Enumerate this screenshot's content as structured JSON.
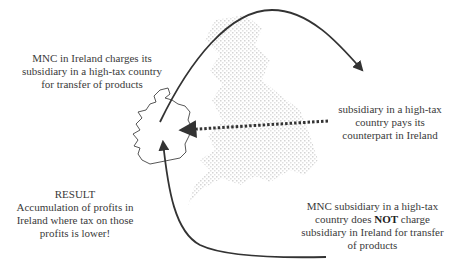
{
  "labels": {
    "top_left": "MNC in Ireland charges its subsidiary in a high-tax country for transfer of products",
    "right": "subsidiary in a high-tax country pays its counterpart in Ireland",
    "result_title": "RESULT",
    "result_body": "Accumulation of profits in Ireland where tax on those profits is lower!",
    "bottom_right_pre": "MNC subsidiary in a high-tax country does ",
    "bottom_right_bold": "NOT",
    "bottom_right_post": " charge subsidiary in Ireland for transfer of products"
  },
  "colors": {
    "arrow": "#333333",
    "map_ireland": "#444444",
    "map_britain": "#d8d8d8",
    "text": "#3a3a3a"
  },
  "diagram": {
    "nodes": [
      "Ireland (MNC)",
      "High-tax country (subsidiary)"
    ],
    "edges": [
      {
        "from": "Ireland",
        "to": "High-tax country",
        "style": "solid",
        "meaning": "charges for transfer of products"
      },
      {
        "from": "High-tax country",
        "to": "Ireland",
        "style": "dotted",
        "meaning": "payment"
      },
      {
        "from": "High-tax country",
        "to": "Ireland",
        "style": "solid",
        "meaning": "does NOT charge"
      }
    ]
  }
}
